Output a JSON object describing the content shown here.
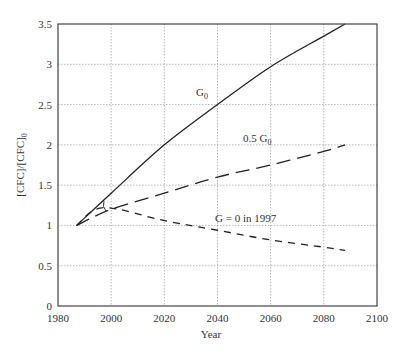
{
  "chart_data": {
    "type": "line",
    "title": "",
    "xlabel": "Year",
    "ylabel": "[CFC]/[CFC]0",
    "xlim": [
      1980,
      2100
    ],
    "ylim": [
      0,
      3.5
    ],
    "x_ticks": [
      "1980",
      "2000",
      "2020",
      "2040",
      "2060",
      "2080",
      "2100"
    ],
    "y_ticks": [
      "0",
      "0.5",
      "1",
      "1.5",
      "2",
      "2.5",
      "3",
      "3.5"
    ],
    "grid": true,
    "legend": "inline annotations",
    "series": [
      {
        "name": "G0",
        "style": "solid",
        "x": [
          1987,
          2000,
          2020,
          2040,
          2060,
          2080,
          2088
        ],
        "y": [
          1.0,
          1.4,
          2.0,
          2.5,
          2.97,
          3.35,
          3.5
        ]
      },
      {
        "name": "0.5 G0",
        "style": "long-dash",
        "x": [
          1987,
          2000,
          2020,
          2040,
          2060,
          2080,
          2088
        ],
        "y": [
          1.0,
          1.2,
          1.4,
          1.6,
          1.75,
          1.92,
          2.0
        ]
      },
      {
        "name": "G = 0 in 1997",
        "style": "short-dash",
        "x": [
          1987,
          1997,
          2020,
          2040,
          2060,
          2080,
          2088
        ],
        "y": [
          1.0,
          1.22,
          1.06,
          0.94,
          0.82,
          0.73,
          0.69
        ]
      }
    ],
    "annotations": [
      {
        "text": "G0",
        "x": 2030,
        "y": 2.8
      },
      {
        "text": "0.5 G0",
        "x": 2050,
        "y": 2.15
      },
      {
        "text": "G = 0 in 1997",
        "x": 2049,
        "y": 1.1
      }
    ]
  },
  "labels": {
    "xlabel": "Year",
    "ylabel_main": "[CFC]/[CFC]",
    "ylabel_sub": "0",
    "g0_main": "G",
    "g0_sub": "0",
    "half_main": "0.5 G",
    "half_sub": "0",
    "zero": "G = 0 in 1997"
  }
}
